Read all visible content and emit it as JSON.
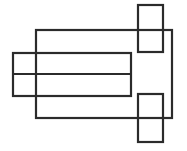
{
  "figure": {
    "canvas": {
      "width": 187,
      "height": 151,
      "background": "#ffffff"
    },
    "stroke": {
      "color": "#2b2b2b",
      "width": 2.2,
      "linejoin": "miter",
      "linecap": "butt"
    },
    "shapes": [
      {
        "name": "large-body-rectangle",
        "role": "main-outline",
        "x": 36,
        "y": 30,
        "width": 136,
        "height": 88,
        "x2": 172,
        "y2": 118
      },
      {
        "name": "wide-horizontal-band-rectangle",
        "role": "overlapping-band",
        "x": 13,
        "y": 53,
        "width": 118,
        "height": 43,
        "x2": 131,
        "y2": 96
      },
      {
        "name": "band-middle-divider-line",
        "role": "divider",
        "x1": 13,
        "y1": 74,
        "x2": 131,
        "y2": 74
      },
      {
        "name": "top-right-square",
        "role": "tab-square",
        "x": 138,
        "y": 5,
        "width": 25,
        "height": 47,
        "x2": 163,
        "y2": 52
      },
      {
        "name": "bottom-right-square",
        "role": "tab-square",
        "x": 138,
        "y": 94,
        "width": 25,
        "height": 48,
        "x2": 163,
        "y2": 142
      }
    ]
  }
}
